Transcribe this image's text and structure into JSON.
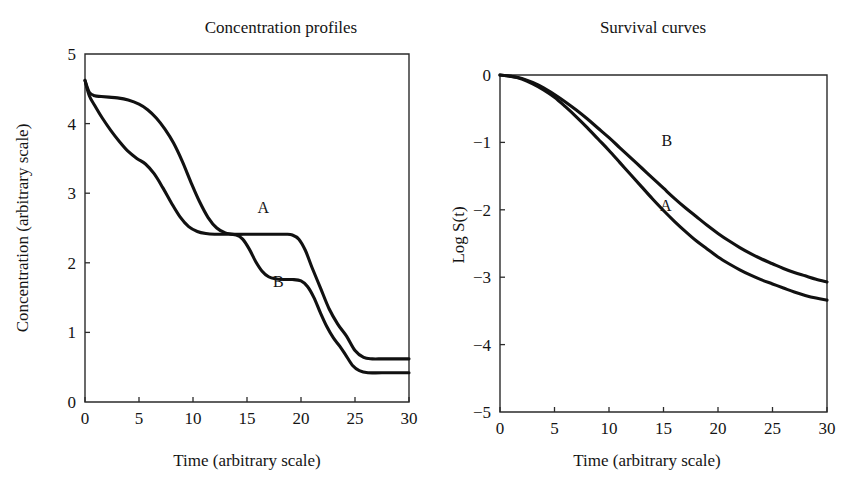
{
  "figure": {
    "background": "#ffffff",
    "curve_color": "#111111",
    "axis_color": "#2b2b2b"
  },
  "chart_data": [
    {
      "id": "concentration-profiles",
      "type": "line",
      "title": "Concentration profiles",
      "xlabel": "Time (arbitrary scale)",
      "ylabel": "Concentration (arbitrary scale)",
      "xlim": [
        0,
        30
      ],
      "ylim": [
        0,
        5
      ],
      "xticks": [
        0,
        5,
        10,
        15,
        20,
        25,
        30
      ],
      "yticks": [
        0,
        1,
        2,
        3,
        4,
        5
      ],
      "xticklabels": [
        "0",
        "5",
        "10",
        "15",
        "20",
        "25",
        "30"
      ],
      "yticklabels": [
        "0",
        "1",
        "2",
        "3",
        "4",
        "5"
      ],
      "grid": false,
      "legend": "inline-annotations",
      "annotations": [
        {
          "text": "A",
          "x": 16.5,
          "y": 2.72
        },
        {
          "text": "B",
          "x": 17.9,
          "y": 1.65
        }
      ],
      "series": [
        {
          "name": "A",
          "x": [
            0,
            0.4,
            0.9,
            1.5,
            2.2,
            3.0,
            4.0,
            5.0,
            5.8,
            6.6,
            7.4,
            8.2,
            9.0,
            9.8,
            10.6,
            11.4,
            12.2,
            13.0,
            14.0,
            15.0,
            16.0,
            17.0,
            18.0,
            18.6,
            19.2,
            19.8,
            20.4,
            21.0,
            21.8,
            22.6,
            23.4,
            24.2,
            25.0,
            25.8,
            26.6,
            27.5,
            28.5,
            30.0
          ],
          "y": [
            4.62,
            4.45,
            4.4,
            4.39,
            4.38,
            4.37,
            4.34,
            4.28,
            4.2,
            4.08,
            3.92,
            3.72,
            3.46,
            3.16,
            2.88,
            2.65,
            2.5,
            2.43,
            2.41,
            2.41,
            2.41,
            2.41,
            2.41,
            2.41,
            2.4,
            2.34,
            2.18,
            1.94,
            1.64,
            1.34,
            1.12,
            0.95,
            0.74,
            0.64,
            0.62,
            0.62,
            0.62,
            0.62
          ]
        },
        {
          "name": "B",
          "x": [
            0,
            0.4,
            0.9,
            1.6,
            2.4,
            3.2,
            4.0,
            4.8,
            5.6,
            6.4,
            7.2,
            8.0,
            8.8,
            9.6,
            10.4,
            11.2,
            12.0,
            13.0,
            14.0,
            14.6,
            15.2,
            15.8,
            16.4,
            17.0,
            17.6,
            18.4,
            19.2,
            20.0,
            20.6,
            21.2,
            21.8,
            22.4,
            23.0,
            23.6,
            24.2,
            24.8,
            25.4,
            26.2,
            27.5,
            30.0
          ],
          "y": [
            4.62,
            4.4,
            4.26,
            4.08,
            3.9,
            3.74,
            3.6,
            3.5,
            3.42,
            3.28,
            3.08,
            2.86,
            2.66,
            2.52,
            2.45,
            2.42,
            2.41,
            2.41,
            2.4,
            2.34,
            2.2,
            2.02,
            1.88,
            1.8,
            1.77,
            1.76,
            1.76,
            1.74,
            1.66,
            1.5,
            1.28,
            1.08,
            0.92,
            0.8,
            0.66,
            0.52,
            0.45,
            0.42,
            0.42,
            0.42
          ]
        }
      ]
    },
    {
      "id": "survival-curves",
      "type": "line",
      "title": "Survival curves",
      "xlabel": "Time (arbitrary scale)",
      "ylabel": "Log S(t)",
      "xlim": [
        0,
        30
      ],
      "ylim": [
        -5,
        0
      ],
      "xticks": [
        0,
        5,
        10,
        15,
        20,
        25,
        30
      ],
      "yticks": [
        -5,
        -4,
        -3,
        -2,
        -1,
        0
      ],
      "xticklabels": [
        "0",
        "5",
        "10",
        "15",
        "20",
        "25",
        "30"
      ],
      "yticklabels": [
        "−5",
        "−4",
        "−3",
        "−2",
        "−1",
        "0"
      ],
      "grid": false,
      "legend": "inline-annotations",
      "annotations": [
        {
          "text": "B",
          "x": 15.3,
          "y": -1.05
        },
        {
          "text": "A",
          "x": 15.2,
          "y": -2.02
        }
      ],
      "series": [
        {
          "name": "A",
          "x": [
            0,
            1,
            2,
            3,
            4,
            5,
            6,
            7,
            8,
            9,
            10,
            11,
            12,
            13,
            14,
            15,
            16,
            17,
            18,
            19,
            20,
            21,
            22,
            23,
            24,
            25,
            26,
            27,
            28,
            29,
            30
          ],
          "y": [
            0.0,
            -0.02,
            -0.06,
            -0.13,
            -0.22,
            -0.33,
            -0.47,
            -0.62,
            -0.78,
            -0.95,
            -1.12,
            -1.3,
            -1.48,
            -1.66,
            -1.84,
            -2.01,
            -2.17,
            -2.32,
            -2.46,
            -2.58,
            -2.7,
            -2.8,
            -2.89,
            -2.97,
            -3.04,
            -3.1,
            -3.16,
            -3.22,
            -3.27,
            -3.31,
            -3.34
          ]
        },
        {
          "name": "B",
          "x": [
            0,
            1,
            2,
            3,
            4,
            5,
            6,
            7,
            8,
            9,
            10,
            11,
            12,
            13,
            14,
            15,
            16,
            17,
            18,
            19,
            20,
            21,
            22,
            23,
            24,
            25,
            26,
            27,
            28,
            29,
            30
          ],
          "y": [
            0.0,
            -0.02,
            -0.05,
            -0.11,
            -0.19,
            -0.29,
            -0.4,
            -0.52,
            -0.65,
            -0.79,
            -0.93,
            -1.08,
            -1.23,
            -1.38,
            -1.53,
            -1.68,
            -1.83,
            -1.97,
            -2.1,
            -2.23,
            -2.35,
            -2.46,
            -2.56,
            -2.65,
            -2.73,
            -2.8,
            -2.87,
            -2.93,
            -2.98,
            -3.03,
            -3.07
          ]
        }
      ]
    }
  ]
}
